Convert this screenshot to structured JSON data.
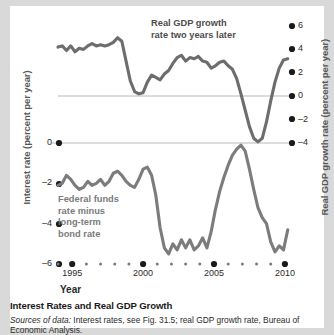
{
  "figure": {
    "caption_title": "Interest Rates and Real GDP Growth",
    "source_prefix": "Sources of data:",
    "source_rest": " Interest rates, see Fig. 31.5; real GDP growth rate, Bureau of Economic Analysis."
  },
  "chart_data": {
    "type": "line",
    "title": "Interest Rates and Real GDP Growth",
    "xlabel": "Year",
    "ylabel": "Interest rate (percent per year)",
    "y2label": "Real GDP growth rate (percent per year)",
    "xlim": [
      1994,
      2010.5
    ],
    "xticks": [
      1995,
      2000,
      2005,
      2010
    ],
    "xticklabels": [
      "1995",
      "2000",
      "2005",
      "2010"
    ],
    "ylim": [
      -6,
      0
    ],
    "yticks": [
      0,
      -2,
      -4,
      -6
    ],
    "yticklabels": [
      "0",
      "-2",
      "-4",
      "-6"
    ],
    "y2lim": [
      -4,
      6
    ],
    "y2ticks": [
      6,
      4,
      2,
      0,
      -2,
      -4
    ],
    "y2ticklabels": [
      "6",
      "4",
      "2",
      "0",
      "-2",
      "-4"
    ],
    "grid": false,
    "gridlines_y2": [
      0,
      -4
    ],
    "legend_position": "inline-annotation",
    "line_color": "#6d6d6f",
    "gridline_color": "#b9b9bb",
    "series": [
      {
        "name": "Real GDP growth rate two years later",
        "axis": "right",
        "annotation": "Real GDP growth rate\ntwo years later",
        "annotation_line1": "Real GDP growth",
        "annotation_line2": "rate two years later",
        "x": [
          1994.0,
          1994.3,
          1994.6,
          1994.9,
          1995.2,
          1995.5,
          1995.8,
          1996.1,
          1996.4,
          1996.7,
          1997.0,
          1997.3,
          1997.6,
          1997.9,
          1998.2,
          1998.5,
          1998.8,
          1999.1,
          1999.4,
          1999.7,
          2000.0,
          2000.3,
          2000.6,
          2000.9,
          2001.2,
          2001.5,
          2001.8,
          2002.1,
          2002.4,
          2002.7,
          2003.0,
          2003.3,
          2003.6,
          2003.9,
          2004.2,
          2004.5,
          2004.8,
          2005.1,
          2005.4,
          2005.7,
          2006.0,
          2006.3,
          2006.6,
          2006.9,
          2007.2,
          2007.5,
          2007.8,
          2008.1,
          2008.4,
          2008.7,
          2009.0,
          2009.3,
          2009.6,
          2009.9,
          2010.2
        ],
        "y": [
          4.2,
          4.3,
          3.9,
          4.3,
          3.8,
          4.1,
          4.0,
          4.3,
          4.5,
          4.3,
          4.4,
          4.3,
          4.4,
          4.6,
          5.0,
          4.7,
          3.0,
          1.3,
          0.4,
          0.2,
          0.3,
          1.2,
          1.8,
          1.6,
          1.4,
          1.9,
          2.2,
          2.8,
          3.3,
          3.5,
          3.0,
          3.3,
          3.2,
          3.4,
          3.0,
          2.9,
          2.4,
          2.6,
          2.9,
          3.0,
          2.6,
          2.3,
          1.5,
          0.2,
          -1.2,
          -2.6,
          -3.6,
          -3.9,
          -3.6,
          -2.2,
          -0.4,
          1.2,
          2.4,
          3.1,
          3.2
        ]
      },
      {
        "name": "Federal funds rate minus long-term bond rate",
        "axis": "left",
        "annotation": "Federal funds rate minus long-term bond rate",
        "annotation_line1": "Federal funds",
        "annotation_line2": "rate minus",
        "annotation_line3": "long-term",
        "annotation_line4": "bond rate",
        "x": [
          1994.0,
          1994.3,
          1994.6,
          1994.9,
          1995.2,
          1995.5,
          1995.8,
          1996.1,
          1996.4,
          1996.7,
          1997.0,
          1997.3,
          1997.6,
          1997.9,
          1998.2,
          1998.5,
          1998.8,
          1999.1,
          1999.4,
          1999.7,
          2000.0,
          2000.3,
          2000.6,
          2000.9,
          2001.2,
          2001.5,
          2001.8,
          2002.1,
          2002.4,
          2002.7,
          2003.0,
          2003.3,
          2003.6,
          2003.9,
          2004.2,
          2004.5,
          2004.8,
          2005.1,
          2005.4,
          2005.7,
          2006.0,
          2006.3,
          2006.6,
          2006.9,
          2007.2,
          2007.5,
          2007.8,
          2008.1,
          2008.4,
          2008.7,
          2009.0,
          2009.3,
          2009.6,
          2009.9,
          2010.2
        ],
        "y": [
          -2.1,
          -2.0,
          -1.6,
          -1.8,
          -2.1,
          -2.3,
          -2.2,
          -1.9,
          -2.1,
          -2.0,
          -1.8,
          -2.1,
          -1.9,
          -1.5,
          -1.4,
          -1.6,
          -1.9,
          -2.1,
          -2.2,
          -1.8,
          -1.3,
          -1.2,
          -1.6,
          -2.6,
          -4.2,
          -5.2,
          -5.5,
          -5.0,
          -5.3,
          -4.8,
          -5.2,
          -4.8,
          -5.3,
          -5.1,
          -4.7,
          -5.2,
          -4.4,
          -3.3,
          -2.4,
          -1.7,
          -1.1,
          -0.6,
          -0.3,
          -0.1,
          -0.4,
          -1.3,
          -2.3,
          -3.2,
          -3.7,
          -4.0,
          -4.9,
          -5.4,
          -5.1,
          -5.3,
          -4.3
        ]
      }
    ]
  },
  "axes": {
    "left_title": "Interest rate (percent per year)",
    "right_title": "Real GDP growth rate (percent per year)",
    "x_title": "Year"
  }
}
